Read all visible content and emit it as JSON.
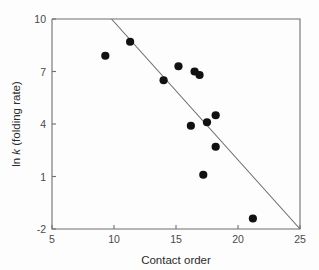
{
  "chart_data": {
    "type": "scatter",
    "title": "",
    "subtitle": "",
    "xlabel": "Contact order",
    "ylabel": "ln k (folding rate)",
    "ylabel_parts": {
      "prefix": "ln ",
      "italic": "k",
      "suffix": " (folding rate)"
    },
    "xlim": [
      5,
      25
    ],
    "ylim": [
      -2,
      10
    ],
    "xticks": [
      5,
      10,
      15,
      20,
      25
    ],
    "yticks": [
      10,
      7,
      4,
      1,
      -2
    ],
    "xtick_labels": [
      "5",
      "10",
      "15",
      "20",
      "25"
    ],
    "ytick_labels": [
      "10",
      "7",
      "4",
      "1",
      "-2"
    ],
    "grid": false,
    "legend": null,
    "legend_position": "none",
    "marker": "filled-circle",
    "marker_color": "#111111",
    "marker_size_px": 4.1,
    "points": [
      {
        "x": 9.3,
        "y": 7.9
      },
      {
        "x": 11.3,
        "y": 8.7
      },
      {
        "x": 14.0,
        "y": 6.5
      },
      {
        "x": 15.2,
        "y": 7.3
      },
      {
        "x": 16.5,
        "y": 7.0
      },
      {
        "x": 16.9,
        "y": 6.8
      },
      {
        "x": 16.2,
        "y": 3.9
      },
      {
        "x": 17.5,
        "y": 4.1
      },
      {
        "x": 18.2,
        "y": 4.5
      },
      {
        "x": 18.2,
        "y": 2.7
      },
      {
        "x": 17.2,
        "y": 1.1
      },
      {
        "x": 21.2,
        "y": -1.4
      }
    ],
    "fit_line": {
      "label": "",
      "color": "#6a6a6a",
      "x_start": 9.8,
      "y_start": 10.0,
      "x_end": 25.0,
      "y_end": -2.0
    },
    "annotations": []
  },
  "figure": {
    "background_color": "#fdfdfd",
    "axis_color": "#6f6f6f",
    "text_color": "#2b2b2b"
  }
}
